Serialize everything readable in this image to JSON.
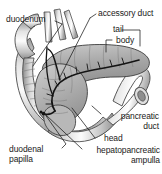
{
  "figure": {
    "type": "anatomical-illustration",
    "background_color": "#ffffff",
    "ink_color": "#1a1a1a",
    "labels": [
      {
        "id": "duodenum",
        "text": "duodenum",
        "position": "top-left",
        "align": "left",
        "points_to": "descending-duodenum"
      },
      {
        "id": "accessory-duct",
        "text": "accessory duct",
        "position": "top-right",
        "align": "left",
        "points_to": "accessory-pancreatic-duct"
      },
      {
        "id": "tail",
        "text": "tail",
        "position": "upper-right",
        "align": "left",
        "points_to": "pancreas-tail"
      },
      {
        "id": "body",
        "text": "body",
        "position": "upper-right",
        "align": "left",
        "points_to": "pancreas-body"
      },
      {
        "id": "pancreatic-duct",
        "text": "pancreatic\nduct",
        "line1": "pancreatic",
        "line2": "duct",
        "position": "lower-right",
        "align": "right",
        "points_to": "main-pancreatic-duct"
      },
      {
        "id": "head",
        "text": "head",
        "position": "lower-right",
        "align": "left",
        "points_to": "pancreas-head"
      },
      {
        "id": "hepatopancreatic-ampulla",
        "text": "hepatopancreatic\nampulla",
        "line1": "hepatopancreatic",
        "line2": "ampulla",
        "position": "bottom-right",
        "align": "right",
        "points_to": "ampulla-of-vater"
      },
      {
        "id": "duodenal-papilla",
        "text": "duodenal\npapilla",
        "line1": "duodenal",
        "line2": "papilla",
        "position": "bottom-left",
        "align": "left",
        "points_to": "major-duodenal-papilla"
      }
    ],
    "structures": [
      {
        "id": "duodenum-loop",
        "name": "duodenum",
        "tone": "#cfcfcf"
      },
      {
        "id": "pancreas-body-tail",
        "name": "body and tail of pancreas",
        "tone": "#a8a8a8"
      },
      {
        "id": "pancreas-head",
        "name": "head of pancreas",
        "tone": "#b4b4b4"
      },
      {
        "id": "main-pancreatic-duct",
        "name": "main pancreatic duct",
        "tone": "#1a1a1a"
      },
      {
        "id": "accessory-pancreatic-duct",
        "name": "accessory pancreatic duct",
        "tone": "#1a1a1a"
      },
      {
        "id": "bile-duct",
        "name": "common bile duct",
        "tone": "#9a9a9a"
      }
    ]
  }
}
